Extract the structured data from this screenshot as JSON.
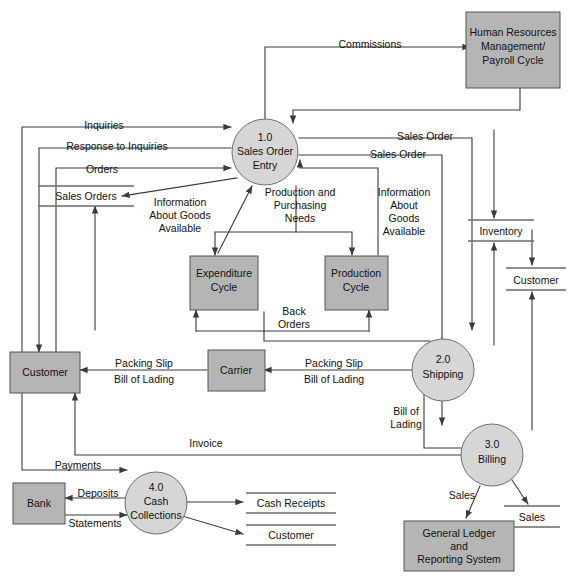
{
  "diagram": {
    "colors": {
      "entity_fill": "#b5b5b5",
      "process_fill": "#d6d6d6",
      "line": "#3a3a3a",
      "store_line": "#6a6a6a",
      "background": "#ffffff"
    }
  },
  "entities": {
    "hr": {
      "line1": "Human Resources",
      "line2": "Management/",
      "line3": "Payroll Cycle"
    },
    "customer_left": {
      "label": "Customer"
    },
    "carrier": {
      "label": "Carrier"
    },
    "bank": {
      "label": "Bank"
    },
    "expenditure": {
      "line1": "Expenditure",
      "line2": "Cycle"
    },
    "production": {
      "line1": "Production",
      "line2": "Cycle"
    },
    "gl": {
      "line1": "General Ledger",
      "line2": "and",
      "line3": "Reporting System"
    }
  },
  "processes": {
    "p1": {
      "number": "1.0",
      "line1": "Sales Order",
      "line2": "Entry"
    },
    "p2": {
      "number": "2.0",
      "line1": "Shipping"
    },
    "p3": {
      "number": "3.0",
      "line1": "Billing"
    },
    "p4": {
      "number": "4.0",
      "line1": "Cash",
      "line2": "Collections"
    }
  },
  "stores": {
    "sales_orders": {
      "label": "Sales Orders"
    },
    "inventory": {
      "label": "Inventory"
    },
    "customer_right": {
      "label": "Customer"
    },
    "sales": {
      "label": "Sales"
    },
    "cash_receipts": {
      "label": "Cash Receipts"
    },
    "customer_bottom": {
      "label": "Customer"
    }
  },
  "flows": {
    "commissions": "Commissions",
    "inquiries": "Inquiries",
    "response_to_inquiries": "Response to Inquiries",
    "orders": "Orders",
    "sales_order_top": "Sales Order",
    "sales_order_second": "Sales Order",
    "info_goods_left_1": "Information",
    "info_goods_left_2": "About Goods",
    "info_goods_left_3": "Available",
    "production_needs_1": "Production and",
    "production_needs_2": "Purchasing",
    "production_needs_3": "Needs",
    "info_goods_right_1": "Information",
    "info_goods_right_2": "About",
    "info_goods_right_3": "Goods",
    "info_goods_right_4": "Available",
    "back_orders_1": "Back",
    "back_orders_2": "Orders",
    "packing_slip_left_1": "Packing Slip",
    "packing_slip_left_2": "Bill of Lading",
    "packing_slip_right_1": "Packing Slip",
    "packing_slip_right_2": "Bill of Lading",
    "bill_of_lading_1": "Bill of",
    "bill_of_lading_2": "Lading",
    "invoice": "Invoice",
    "payments": "Payments",
    "deposits": "Deposits",
    "statements": "Statements",
    "sales_to_gl": "Sales"
  }
}
